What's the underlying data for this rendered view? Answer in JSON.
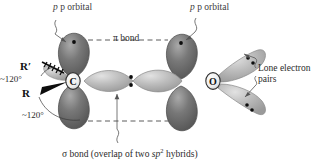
{
  "figure": {
    "background_color": "#ffffff"
  },
  "atoms": [
    {
      "id": "carbon",
      "symbol": "C",
      "x": 73,
      "y": 80
    },
    {
      "id": "oxygen",
      "symbol": "O",
      "x": 213,
      "y": 81
    }
  ],
  "labels": {
    "p_orbital_left": "p orbital",
    "p_orbital_right": "p orbital",
    "pi_bond": "π bond",
    "lone_pairs_line1": "Lone electron",
    "lone_pairs_line2": "pairs",
    "sigma_caption_pre": "σ bond (overlap of two ",
    "sigma_caption_hybrid": "sp",
    "sigma_caption_sup": "2",
    "sigma_caption_post": " hybrids)",
    "substituent_r_prime": "R′",
    "substituent_r": "R",
    "angle_upper": "~120°",
    "angle_lower": "~120°"
  },
  "colors": {
    "p_orbital_dark": "#6f6f6f",
    "p_orbital_dark_edge": "#4a4a4a",
    "hybrid_light": "#b9b9b9",
    "hybrid_light_edge": "#8a8a8a",
    "atom_core": "#efefef",
    "atom_core_edge": "#2f2f2f",
    "electron_dot": "#0d0d0d",
    "dashed_line": "#4b4b4b",
    "leader_line": "#555555",
    "wedge_solid": "#0d0d0d",
    "text": "#2b2b2b"
  },
  "electron_dots": {
    "p_orbital_left": 1,
    "p_orbital_right": 1,
    "sigma_bond_pair": 2,
    "lone_pair_upper": 2,
    "lone_pair_lower": 2
  },
  "annotations": {
    "pi_bond_dashed_line": "horizontal dashed line linking the two upper p orbitals",
    "lower_dashed_line": "horizontal dashed line linking the two lower p lobes",
    "r_prime_bond_style": "hashed wedge (pointing back)",
    "r_bond_style": "solid wedge (pointing forward)"
  }
}
